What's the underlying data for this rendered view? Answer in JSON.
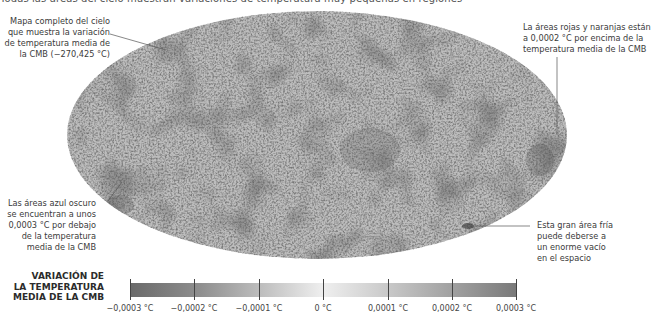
{
  "header": {
    "cut_off_text": "Todas las áreas del cielo muestran variaciones de temperatura muy pequeñas en regiones"
  },
  "map": {
    "title": "Mapa completo del cielo de la CMB",
    "projection": "Mollweide",
    "palette": "grayscale"
  },
  "annotations": {
    "top_left": [
      "Mapa completo del cielo",
      "que muestra la variación",
      "de temperatura media de",
      "la CMB (−270,425 °C)"
    ],
    "top_right": [
      "La áreas rojas y naranjas están",
      "a 0,0002 °C por encima de la",
      "temperatura media de la CMB"
    ],
    "bottom_left": [
      "Las áreas azul oscuro",
      "se encuentran a unos",
      "0,0003 °C por debajo",
      "de la temperatura",
      "media de la CMB"
    ],
    "bottom_right": [
      "Esta gran área fría",
      "puede deberse a",
      "un enorme vacío",
      "en el espacio"
    ]
  },
  "legend": {
    "title_lines": [
      "VARIACIÓN DE",
      "LA TEMPERATURA",
      "MEDIA DE LA CMB"
    ],
    "ticks": [
      "−0,0003 °C",
      "−0,0002 °C",
      "−0,0001 °C",
      "0 °C",
      "0,0001 °C",
      "0,0002 °C",
      "0,0003 °C"
    ]
  },
  "colors": {
    "cold": "#6a6a6a",
    "neutral": "#efefef",
    "warm": "#7a7a7a",
    "leader_line": "#555555"
  }
}
